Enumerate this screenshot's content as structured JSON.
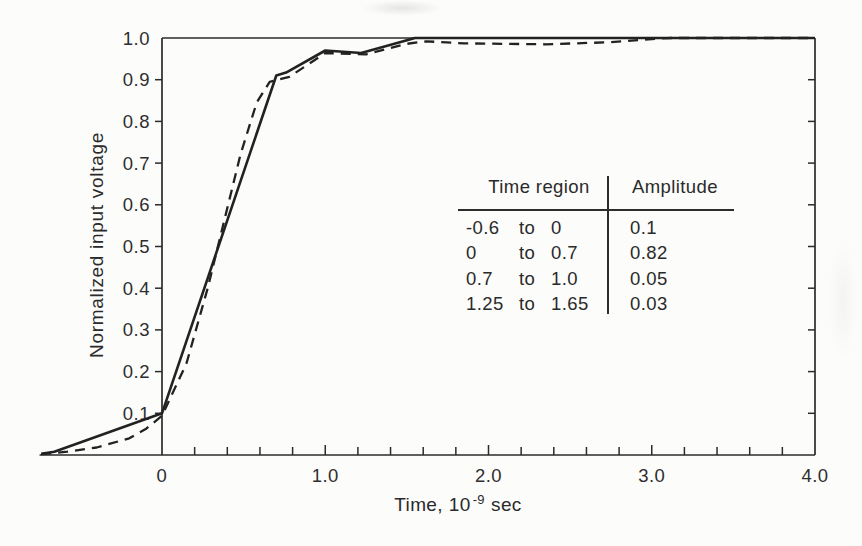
{
  "chart_data": {
    "type": "line",
    "title": "",
    "xlabel": "Time, 10^-9 sec",
    "xlabel_parts": {
      "base": "Time, 10",
      "exponent": "-9",
      "unit": "sec"
    },
    "ylabel": "Normalized input voltage",
    "xlim": [
      -0.75,
      4.0
    ],
    "ylim": [
      0,
      1.0
    ],
    "grid": false,
    "legend": "none",
    "x_major_ticks": [
      0,
      1.0,
      2.0,
      3.0,
      4.0
    ],
    "x_tick_labels": [
      "0",
      "1.0",
      "2.0",
      "3.0",
      "4.0"
    ],
    "x_minor_tick_step": 0.2,
    "y_ticks": [
      0.1,
      0.2,
      0.3,
      0.4,
      0.5,
      0.6,
      0.7,
      0.8,
      0.9,
      1.0
    ],
    "y_tick_labels": [
      "0.1",
      "0.2",
      "0.3",
      "0.4",
      "0.5",
      "0.6",
      "0.7",
      "0.8",
      "0.9",
      "1.0"
    ],
    "series": [
      {
        "name": "solid-curve",
        "style": "solid",
        "points": [
          [
            -0.74,
            0.003
          ],
          [
            -0.66,
            0.008
          ],
          [
            0.0,
            0.1
          ],
          [
            0.7,
            0.91
          ],
          [
            0.76,
            0.917
          ],
          [
            1.0,
            0.97
          ],
          [
            1.22,
            0.964
          ],
          [
            1.55,
            1.0
          ],
          [
            4.0,
            1.0
          ]
        ]
      },
      {
        "name": "dashed-curve",
        "style": "dashed",
        "points": [
          [
            -0.74,
            0.002
          ],
          [
            -0.58,
            0.008
          ],
          [
            -0.4,
            0.018
          ],
          [
            -0.2,
            0.04
          ],
          [
            -0.1,
            0.062
          ],
          [
            0.0,
            0.094
          ],
          [
            0.15,
            0.22
          ],
          [
            0.28,
            0.4
          ],
          [
            0.38,
            0.56
          ],
          [
            0.48,
            0.72
          ],
          [
            0.58,
            0.845
          ],
          [
            0.66,
            0.895
          ],
          [
            0.78,
            0.907
          ],
          [
            1.0,
            0.964
          ],
          [
            1.25,
            0.961
          ],
          [
            1.5,
            0.986
          ],
          [
            1.62,
            0.992
          ],
          [
            1.85,
            0.987
          ],
          [
            2.35,
            0.985
          ],
          [
            2.75,
            0.99
          ],
          [
            3.02,
            0.998
          ],
          [
            3.12,
            1.0
          ],
          [
            4.0,
            1.0
          ]
        ]
      }
    ],
    "inset_table": {
      "col1_header": "Time region",
      "col2_header": "Amplitude",
      "separator_word": "to",
      "rows": [
        {
          "start": "-0.6",
          "end": "0",
          "amplitude": "0.1"
        },
        {
          "start": "0",
          "end": "0.7",
          "amplitude": "0.82"
        },
        {
          "start": "0.7",
          "end": "1.0",
          "amplitude": "0.05"
        },
        {
          "start": "1.25",
          "end": "1.65",
          "amplitude": "0.03"
        }
      ]
    }
  }
}
